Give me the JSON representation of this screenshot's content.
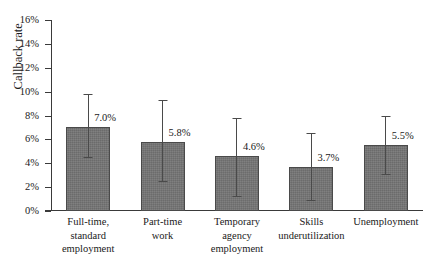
{
  "chart_data": {
    "type": "bar",
    "title": "",
    "subtitle": "",
    "xlabel": "",
    "ylabel": "Callback rate",
    "ylim": [
      0,
      16
    ],
    "y_unit": "%",
    "y_ticks": [
      0,
      2,
      4,
      6,
      8,
      10,
      12,
      14,
      16
    ],
    "y_tick_labels": [
      "0%",
      "2%",
      "4%",
      "6%",
      "8%",
      "10%",
      "12%",
      "14%",
      "16%"
    ],
    "grid": false,
    "legend": null,
    "error_bars": true,
    "categories": [
      "Full-time, standard employment",
      "Part-time work",
      "Temporary agency employment",
      "Skills underutilization",
      "Unemployment"
    ],
    "category_label_lines": [
      [
        "Full-time,",
        "standard",
        "employment"
      ],
      [
        "Part-time",
        "work"
      ],
      [
        "Temporary",
        "agency",
        "employment"
      ],
      [
        "Skills",
        "underutilization"
      ],
      [
        "Unemployment"
      ]
    ],
    "values": [
      7.0,
      5.8,
      4.6,
      3.7,
      5.5
    ],
    "value_labels": [
      "7.0%",
      "5.8%",
      "4.6%",
      "3.7%",
      "5.5%"
    ],
    "error_low": [
      4.4,
      2.4,
      1.2,
      0.8,
      3.0
    ],
    "error_high": [
      9.8,
      9.3,
      7.8,
      6.5,
      8.0
    ],
    "colors": {
      "bar_fill": "#757575",
      "bar_border": "#4a4a4a",
      "axis": "#3a3a3a",
      "text": "#1a1a1a",
      "background": "#ffffff"
    }
  }
}
